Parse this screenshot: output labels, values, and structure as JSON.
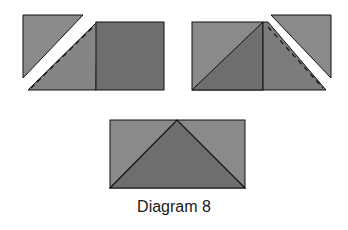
{
  "caption": "Diagram 8",
  "colors": {
    "fill_light": "#8a8a8a",
    "fill_dark": "#6e6e6e",
    "stroke": "#111111",
    "background": "#ffffff"
  },
  "figures": [
    {
      "id": "left-group",
      "description": "Triangle cut off top-left, square with dashed seam line"
    },
    {
      "id": "right-group",
      "description": "Square split by diagonal, triangle cut off top-right with dashed seam line"
    },
    {
      "id": "bottom-rectangle",
      "description": "Flying geese unit: rectangle with center triangle"
    }
  ]
}
